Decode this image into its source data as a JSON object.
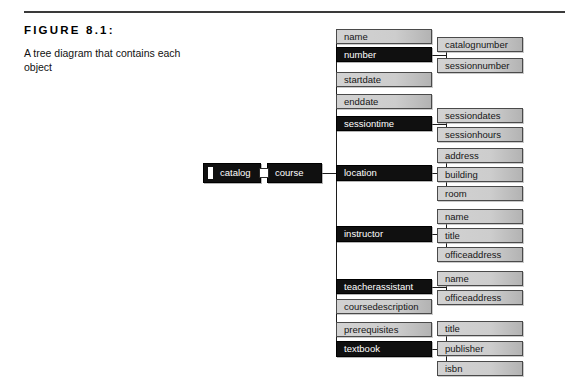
{
  "figure": {
    "label": "FIGURE 8.1:",
    "description": "A tree diagram that contains each object"
  },
  "diagram": {
    "type": "tree",
    "nodes": [
      {
        "id": "catalog",
        "label": "catalog",
        "style": "dark",
        "level": 0,
        "x": 203,
        "y": 163,
        "w": 58,
        "h": 20,
        "tab": true
      },
      {
        "id": "course",
        "label": "course",
        "style": "dark",
        "level": 1,
        "x": 267,
        "y": 163,
        "w": 55,
        "h": 20,
        "tab": false
      },
      {
        "id": "name",
        "label": "name",
        "style": "light",
        "level": 2,
        "x": 336,
        "y": 29,
        "w": 96,
        "h": 15,
        "tab": false
      },
      {
        "id": "number",
        "label": "number",
        "style": "dark",
        "level": 2,
        "x": 336,
        "y": 47,
        "w": 96,
        "h": 15,
        "tab": false
      },
      {
        "id": "startdate",
        "label": "startdate",
        "style": "light",
        "level": 2,
        "x": 336,
        "y": 72,
        "w": 96,
        "h": 15,
        "tab": false
      },
      {
        "id": "enddate",
        "label": "enddate",
        "style": "light",
        "level": 2,
        "x": 336,
        "y": 94,
        "w": 96,
        "h": 15,
        "tab": false
      },
      {
        "id": "sessiontime",
        "label": "sessiontime",
        "style": "dark",
        "level": 2,
        "x": 336,
        "y": 116,
        "w": 96,
        "h": 15,
        "tab": false
      },
      {
        "id": "location",
        "label": "location",
        "style": "dark",
        "level": 2,
        "x": 336,
        "y": 165,
        "w": 96,
        "h": 16,
        "tab": false
      },
      {
        "id": "instructor",
        "label": "instructor",
        "style": "dark",
        "level": 2,
        "x": 336,
        "y": 226,
        "w": 96,
        "h": 16,
        "tab": false
      },
      {
        "id": "teacherassistant",
        "label": "teacherassistant",
        "style": "dark",
        "level": 2,
        "x": 336,
        "y": 279,
        "w": 96,
        "h": 15,
        "tab": false
      },
      {
        "id": "coursedescription",
        "label": "coursedescription",
        "style": "light",
        "level": 2,
        "x": 336,
        "y": 299,
        "w": 96,
        "h": 15,
        "tab": false
      },
      {
        "id": "prerequisites",
        "label": "prerequisites",
        "style": "light",
        "level": 2,
        "x": 336,
        "y": 322,
        "w": 96,
        "h": 15,
        "tab": false
      },
      {
        "id": "textbook",
        "label": "textbook",
        "style": "dark",
        "level": 2,
        "x": 336,
        "y": 341,
        "w": 96,
        "h": 16,
        "tab": false
      },
      {
        "id": "catalognumber",
        "label": "catalognumber",
        "style": "light",
        "level": 3,
        "x": 437,
        "y": 37,
        "w": 86,
        "h": 15,
        "tab": false
      },
      {
        "id": "sessionnumber",
        "label": "sessionnumber",
        "style": "light",
        "level": 3,
        "x": 437,
        "y": 58,
        "w": 86,
        "h": 15,
        "tab": false
      },
      {
        "id": "sessiondates",
        "label": "sessiondates",
        "style": "light",
        "level": 3,
        "x": 437,
        "y": 108,
        "w": 86,
        "h": 15,
        "tab": false
      },
      {
        "id": "sessionhours",
        "label": "sessionhours",
        "style": "light",
        "level": 3,
        "x": 437,
        "y": 127,
        "w": 86,
        "h": 15,
        "tab": false
      },
      {
        "id": "address",
        "label": "address",
        "style": "light",
        "level": 3,
        "x": 437,
        "y": 148,
        "w": 86,
        "h": 15,
        "tab": false
      },
      {
        "id": "building",
        "label": "building",
        "style": "light",
        "level": 3,
        "x": 437,
        "y": 167,
        "w": 86,
        "h": 15,
        "tab": false
      },
      {
        "id": "room",
        "label": "room",
        "style": "light",
        "level": 3,
        "x": 437,
        "y": 186,
        "w": 86,
        "h": 15,
        "tab": false
      },
      {
        "id": "instructor-name",
        "label": "name",
        "style": "light",
        "level": 3,
        "x": 437,
        "y": 209,
        "w": 86,
        "h": 15,
        "tab": false
      },
      {
        "id": "title",
        "label": "title",
        "style": "light",
        "level": 3,
        "x": 437,
        "y": 228,
        "w": 86,
        "h": 15,
        "tab": false
      },
      {
        "id": "officeaddress",
        "label": "officeaddress",
        "style": "light",
        "level": 3,
        "x": 437,
        "y": 247,
        "w": 86,
        "h": 15,
        "tab": false
      },
      {
        "id": "ta-name",
        "label": "name",
        "style": "light",
        "level": 3,
        "x": 437,
        "y": 271,
        "w": 86,
        "h": 15,
        "tab": false
      },
      {
        "id": "ta-officeaddress",
        "label": "officeaddress",
        "style": "light",
        "level": 3,
        "x": 437,
        "y": 290,
        "w": 86,
        "h": 15,
        "tab": false
      },
      {
        "id": "book-title",
        "label": "title",
        "style": "light",
        "level": 3,
        "x": 437,
        "y": 321,
        "w": 86,
        "h": 15,
        "tab": false
      },
      {
        "id": "publisher",
        "label": "publisher",
        "style": "light",
        "level": 3,
        "x": 437,
        "y": 341,
        "w": 86,
        "h": 15,
        "tab": false
      },
      {
        "id": "isbn",
        "label": "isbn",
        "style": "light",
        "level": 3,
        "x": 437,
        "y": 361,
        "w": 86,
        "h": 15,
        "tab": false
      }
    ],
    "edges": [
      {
        "from": "catalog",
        "to": "course"
      },
      {
        "from": "course",
        "to": "name"
      },
      {
        "from": "course",
        "to": "number"
      },
      {
        "from": "course",
        "to": "startdate"
      },
      {
        "from": "course",
        "to": "enddate"
      },
      {
        "from": "course",
        "to": "sessiontime"
      },
      {
        "from": "course",
        "to": "location"
      },
      {
        "from": "course",
        "to": "instructor"
      },
      {
        "from": "course",
        "to": "teacherassistant"
      },
      {
        "from": "course",
        "to": "coursedescription"
      },
      {
        "from": "course",
        "to": "prerequisites"
      },
      {
        "from": "course",
        "to": "textbook"
      },
      {
        "from": "number",
        "to": "catalognumber"
      },
      {
        "from": "number",
        "to": "sessionnumber"
      },
      {
        "from": "sessiontime",
        "to": "sessiondates"
      },
      {
        "from": "sessiontime",
        "to": "sessionhours"
      },
      {
        "from": "location",
        "to": "address"
      },
      {
        "from": "location",
        "to": "building"
      },
      {
        "from": "location",
        "to": "room"
      },
      {
        "from": "instructor",
        "to": "instructor-name"
      },
      {
        "from": "instructor",
        "to": "title"
      },
      {
        "from": "instructor",
        "to": "officeaddress"
      },
      {
        "from": "teacherassistant",
        "to": "ta-name"
      },
      {
        "from": "teacherassistant",
        "to": "ta-officeaddress"
      },
      {
        "from": "textbook",
        "to": "book-title"
      },
      {
        "from": "textbook",
        "to": "publisher"
      },
      {
        "from": "textbook",
        "to": "isbn"
      }
    ],
    "colors": {
      "dark_node": "#101010",
      "dark_text": "#ffffff",
      "light_node": "#cdcdcd",
      "light_text": "#161616",
      "edge": "#1c1c1c",
      "rule": "#3a3a3a",
      "background": "#ffffff"
    }
  }
}
